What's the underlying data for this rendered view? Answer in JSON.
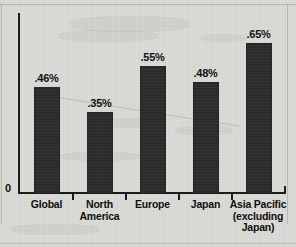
{
  "chart_data": {
    "type": "bar",
    "title": "",
    "subtitle": "",
    "xlabel": "",
    "ylabel": "",
    "categories": [
      "Global",
      "North America",
      "Europe",
      "Japan",
      "Asia Pacific (excluding Japan)"
    ],
    "category_lines": [
      [
        "Global"
      ],
      [
        "North",
        "America"
      ],
      [
        "Europe"
      ],
      [
        "Japan"
      ],
      [
        "Asia Pacific",
        "(excluding",
        "Japan)"
      ]
    ],
    "values": [
      0.46,
      0.35,
      0.55,
      0.48,
      0.65
    ],
    "value_labels": [
      ".46%",
      ".35%",
      ".55%",
      ".48%",
      ".65%"
    ],
    "ylim": [
      0,
      0.78
    ],
    "y_tick_labels": [
      "0"
    ],
    "grid": false,
    "legend": false,
    "legend_position": "none",
    "bar_color": "#2b2b2b",
    "background_color": "#d9d9d6",
    "axis_color": "#1c1c1c",
    "text_color": "#101010"
  },
  "axis": {
    "zero_label": "0"
  }
}
